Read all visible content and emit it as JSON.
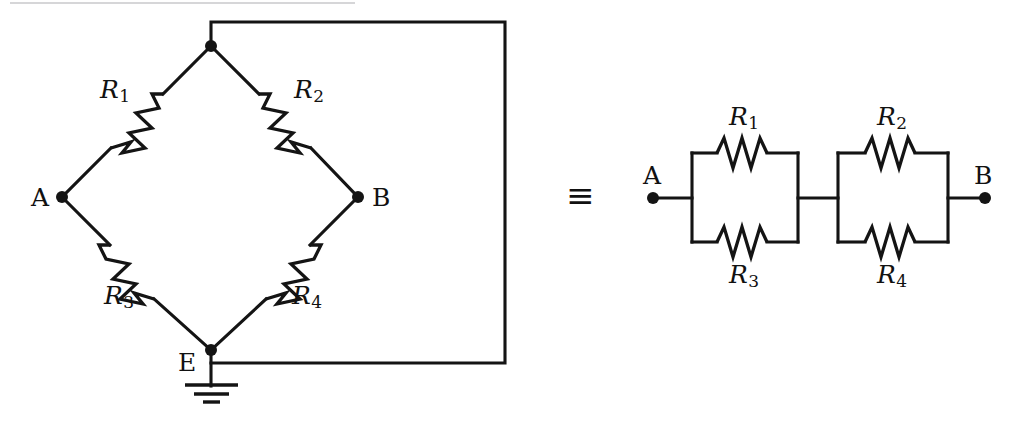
{
  "figure": {
    "equivalence_symbol": "≡",
    "ink_color": "#141414",
    "background_color": "#ffffff",
    "rule_color": "#d6d6d8"
  },
  "bridge_diagram": {
    "name": "diamond-bridge",
    "nodes": [
      {
        "id": "top",
        "label": "",
        "x": 211,
        "y": 46,
        "has_dot": true
      },
      {
        "id": "A",
        "label": "A",
        "x": 62,
        "y": 197,
        "has_dot": true
      },
      {
        "id": "B",
        "label": "B",
        "x": 358,
        "y": 197,
        "has_dot": true
      },
      {
        "id": "E",
        "label": "E",
        "x": 211,
        "y": 350,
        "has_dot": true
      }
    ],
    "resistors": [
      {
        "id": "R1",
        "label": "R",
        "subscript": "1",
        "between": [
          "top",
          "A"
        ],
        "label_x": 100,
        "label_y": 77
      },
      {
        "id": "R2",
        "label": "R",
        "subscript": "2",
        "between": [
          "top",
          "B"
        ],
        "label_x": 294,
        "label_y": 77
      },
      {
        "id": "R3",
        "label": "R",
        "subscript": "3",
        "between": [
          "A",
          "E"
        ],
        "label_x": 104,
        "label_y": 283
      },
      {
        "id": "R4",
        "label": "R",
        "subscript": "4",
        "between": [
          "E",
          "B"
        ],
        "label_x": 292,
        "label_y": 283
      }
    ],
    "ground": {
      "at_node": "E",
      "symbol": "earth-ground",
      "bars": 3
    },
    "feedback_wire": {
      "from": "top",
      "to": "E",
      "path": "top-up-right-down-left",
      "right_x": 505
    }
  },
  "equivalent_diagram": {
    "name": "series-parallel",
    "terminals": [
      {
        "id": "A",
        "label": "A",
        "x": 653,
        "y": 198
      },
      {
        "id": "B",
        "label": "B",
        "x": 985,
        "y": 198
      }
    ],
    "blocks": [
      {
        "id": "block-1",
        "top_resistor": {
          "label": "R",
          "subscript": "1",
          "label_x": 745,
          "label_y": 118
        },
        "bottom_resistor": {
          "label": "R",
          "subscript": "3",
          "label_x": 745,
          "label_y": 262
        }
      },
      {
        "id": "block-2",
        "top_resistor": {
          "label": "R",
          "subscript": "2",
          "label_x": 893,
          "label_y": 118
        },
        "bottom_resistor": {
          "label": "R",
          "subscript": "4",
          "label_x": 893,
          "label_y": 262
        }
      }
    ]
  },
  "labels": {
    "node_a_left": "A",
    "node_b_left": "B",
    "node_e_left": "E",
    "node_a_right": "A",
    "node_b_right": "B",
    "r1": "R",
    "r2": "R",
    "r3": "R",
    "r4": "R",
    "sub1": "1",
    "sub2": "2",
    "sub3": "3",
    "sub4": "4",
    "equiv": "≡"
  }
}
